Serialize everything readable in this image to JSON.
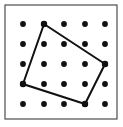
{
  "figure": {
    "background_color": "#ffffff",
    "frame": {
      "x": 5,
      "y": 5,
      "width": 112,
      "height": 114,
      "stroke_color": "#4d4d4d",
      "stroke_width": 1.2,
      "fill_color": "#ffffff"
    },
    "dots": {
      "label": "lattice-points",
      "color": "#111111",
      "radius": 2.9,
      "rows": 5,
      "cols": 5,
      "x_positions": [
        23,
        44,
        64,
        85,
        105
      ],
      "y_positions": [
        24,
        44,
        64,
        84,
        104
      ]
    },
    "polygon": {
      "label": "quadrilateral",
      "stroke_color": "#111111",
      "stroke_width": 2.0,
      "fill_color": "none",
      "vertex_marker_radius": 3.2,
      "vertices": [
        {
          "name": "top-vertex",
          "col": 1,
          "row": 0,
          "x": 44,
          "y": 24
        },
        {
          "name": "right-vertex",
          "col": 4,
          "row": 2,
          "x": 105,
          "y": 64
        },
        {
          "name": "bottom-vertex",
          "col": 3,
          "row": 4,
          "x": 85,
          "y": 104
        },
        {
          "name": "left-vertex",
          "col": 0,
          "row": 3,
          "x": 23,
          "y": 84
        }
      ]
    }
  },
  "chart_data": {
    "type": "scatter",
    "xlabel": "",
    "ylabel": "",
    "xlim": [
      0,
      4
    ],
    "ylim": [
      0,
      4
    ],
    "grid": false,
    "legend": "none",
    "categories": [
      "lattice-points",
      "quadrilateral"
    ],
    "series": [
      {
        "name": "lattice-points",
        "marker": "filled-circle",
        "color": "#111111",
        "points": [
          [
            0,
            4
          ],
          [
            1,
            4
          ],
          [
            2,
            4
          ],
          [
            3,
            4
          ],
          [
            4,
            4
          ],
          [
            0,
            3
          ],
          [
            1,
            3
          ],
          [
            2,
            3
          ],
          [
            3,
            3
          ],
          [
            4,
            3
          ],
          [
            0,
            2
          ],
          [
            1,
            2
          ],
          [
            2,
            2
          ],
          [
            3,
            2
          ],
          [
            4,
            2
          ],
          [
            0,
            1
          ],
          [
            1,
            1
          ],
          [
            2,
            1
          ],
          [
            3,
            1
          ],
          [
            4,
            1
          ],
          [
            0,
            0
          ],
          [
            1,
            0
          ],
          [
            2,
            0
          ],
          [
            3,
            0
          ],
          [
            4,
            0
          ]
        ]
      },
      {
        "name": "quadrilateral",
        "marker": "line-closed",
        "color": "#111111",
        "points": [
          [
            1,
            4
          ],
          [
            4,
            2
          ],
          [
            3,
            0
          ],
          [
            0,
            1
          ]
        ]
      }
    ]
  }
}
